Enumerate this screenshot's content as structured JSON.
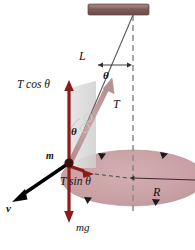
{
  "figure": {
    "labels": {
      "length": "L",
      "angle_top": "θ",
      "tension": "T",
      "tension_vertical": "T cos θ",
      "tension_horizontal": "T sin θ",
      "angle_body": "θ",
      "mass": "m",
      "velocity": "v",
      "weight": "mg",
      "radius": "R"
    },
    "colors": {
      "ceiling": "#7a5a57",
      "ceiling_top": "#9b7d79",
      "force_arrow": "#8f1a1a",
      "tension_arrow": "#c09a9a",
      "disk_fill": "#c9a0a4",
      "disk_edge": "#b58a90",
      "shade_panel": "#d8d8d8",
      "string": "#4a4a4a",
      "dashed": "#8a8a8a",
      "velocity_arrow": "#000000",
      "mass_dot": "#3a1010"
    },
    "geometry": {
      "pivot_x": 133,
      "pivot_y": 15,
      "mass_x": 70,
      "mass_y": 163,
      "disk_center_x": 133,
      "disk_center_y": 178,
      "disk_radius_x": 72,
      "disk_radius_y": 28
    }
  }
}
